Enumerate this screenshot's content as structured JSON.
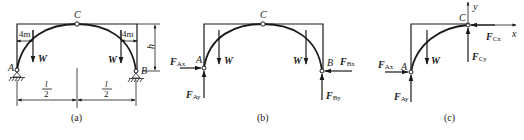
{
  "figure": {
    "panels": [
      {
        "id": "a",
        "caption": "(a)",
        "points": {
          "A": "A",
          "B": "B",
          "C": "C"
        },
        "loads": {
          "left": "W",
          "right": "W"
        },
        "dimensions": {
          "offset_left": "4m",
          "offset_right": "4m",
          "height": "h",
          "half_span_left": {
            "num": "l",
            "den": "2"
          },
          "half_span_right": {
            "num": "l",
            "den": "2"
          }
        }
      },
      {
        "id": "b",
        "caption": "(b)",
        "points": {
          "A": "A",
          "B": "B",
          "C": "C"
        },
        "loads": {
          "left": "W",
          "right": "W"
        },
        "forces": {
          "FAx": {
            "main": "F",
            "sub": "Ax"
          },
          "FAy": {
            "main": "F",
            "sub": "Ay"
          },
          "FBx": {
            "main": "F",
            "sub": "Bx"
          },
          "FBy": {
            "main": "F",
            "sub": "By"
          }
        }
      },
      {
        "id": "c",
        "caption": "(c)",
        "points": {
          "A": "A",
          "C": "C"
        },
        "loads": {
          "left": "W"
        },
        "axes": {
          "x": "x",
          "y": "y"
        },
        "forces": {
          "FAx": {
            "main": "F",
            "sub": "Ax"
          },
          "FAy": {
            "main": "F",
            "sub": "Ay"
          },
          "FCx": {
            "main": "F",
            "sub": "Cx"
          },
          "FCy": {
            "main": "F",
            "sub": "Cy"
          }
        }
      }
    ]
  }
}
